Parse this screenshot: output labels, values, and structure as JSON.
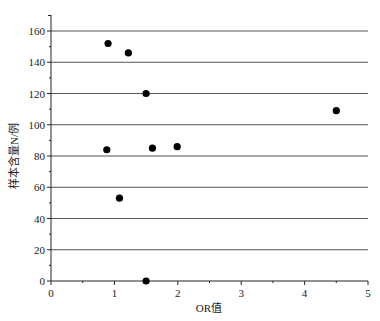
{
  "chart_data": {
    "type": "scatter",
    "title": "",
    "xlabel": "OR值",
    "ylabel": "样本含量N/例",
    "xlim": [
      0,
      5
    ],
    "ylim": [
      0,
      160
    ],
    "x_ticks": [
      0,
      1,
      2,
      3,
      4,
      5
    ],
    "y_ticks": [
      0,
      20,
      40,
      60,
      80,
      100,
      120,
      140,
      160
    ],
    "x_tick_labels": [
      "0",
      "1",
      "2",
      "3",
      "4",
      "5"
    ],
    "y_tick_labels": [
      "0",
      "20",
      "40",
      "60",
      "80",
      "100",
      "120",
      "140",
      "160"
    ],
    "grid": {
      "horizontal": true,
      "vertical": false
    },
    "legend": null,
    "series": [
      {
        "name": "studies",
        "marker": "circle",
        "color": "#000000",
        "points": [
          {
            "x": 0.9,
            "y": 152
          },
          {
            "x": 1.22,
            "y": 146
          },
          {
            "x": 1.5,
            "y": 120
          },
          {
            "x": 0.88,
            "y": 84
          },
          {
            "x": 1.6,
            "y": 85
          },
          {
            "x": 1.99,
            "y": 86
          },
          {
            "x": 1.08,
            "y": 53
          },
          {
            "x": 1.5,
            "y": 0
          },
          {
            "x": 4.5,
            "y": 109
          }
        ]
      }
    ]
  },
  "colors": {
    "axis": "#222222",
    "grid": "#555555",
    "marker": "#000000"
  }
}
